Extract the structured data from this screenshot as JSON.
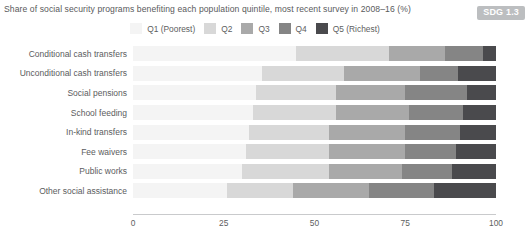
{
  "title": "Share of social security programs benefiting each population quintile, most recent survey in 2008–16 (%)",
  "badge": {
    "label": "SDG 1.3"
  },
  "colors": {
    "q1": "#f4f4f4",
    "q2": "#d8d8d8",
    "q3": "#a9a9a9",
    "q4": "#858585",
    "q5": "#4a4a4d",
    "axis": "#c9cacc",
    "text": "#5b5c5e",
    "badge_bg": "#bcbec0"
  },
  "legend": {
    "items": [
      {
        "label": "Q1 (Poorest)",
        "color": "#f4f4f4"
      },
      {
        "label": "Q2",
        "color": "#d8d8d8"
      },
      {
        "label": "Q3",
        "color": "#a9a9a9"
      },
      {
        "label": "Q4",
        "color": "#858585"
      },
      {
        "label": "Q5 (Richest)",
        "color": "#4a4a4d"
      }
    ]
  },
  "chart_data": {
    "type": "bar",
    "orientation": "horizontal",
    "stacked": true,
    "stack_total": 100,
    "title": "Share of social security programs benefiting each population quintile, most recent survey in 2008–16 (%)",
    "xlabel": "",
    "ylabel": "",
    "xlim": [
      0,
      100
    ],
    "xticks": [
      0,
      25,
      50,
      75,
      100
    ],
    "xtick_labels": [
      "0",
      "25",
      "50",
      "75",
      "100"
    ],
    "grid": false,
    "legend_position": "top-center",
    "categories": [
      "Conditional cash transfers",
      "Unconditional cash transfers",
      "Social pensions",
      "School feeding",
      "In-kind transfers",
      "Fee waivers",
      "Public works",
      "Other social assistance"
    ],
    "series": [
      {
        "name": "Q1 (Poorest)",
        "color": "#f4f4f4",
        "values": [
          45,
          35.5,
          34,
          33,
          32,
          31,
          30,
          26
        ]
      },
      {
        "name": "Q2",
        "color": "#d8d8d8",
        "values": [
          25.5,
          22.5,
          22,
          23,
          22,
          23,
          24,
          18
        ]
      },
      {
        "name": "Q3",
        "color": "#a9a9a9",
        "values": [
          15.5,
          21,
          19,
          20,
          21,
          21,
          20,
          21
        ]
      },
      {
        "name": "Q4",
        "color": "#858585",
        "values": [
          10.5,
          10.5,
          17,
          15,
          15,
          14,
          14,
          18
        ]
      },
      {
        "name": "Q5 (Richest)",
        "color": "#4a4a4d",
        "values": [
          3.5,
          10.5,
          8,
          9,
          10,
          11,
          12,
          17
        ]
      }
    ]
  }
}
